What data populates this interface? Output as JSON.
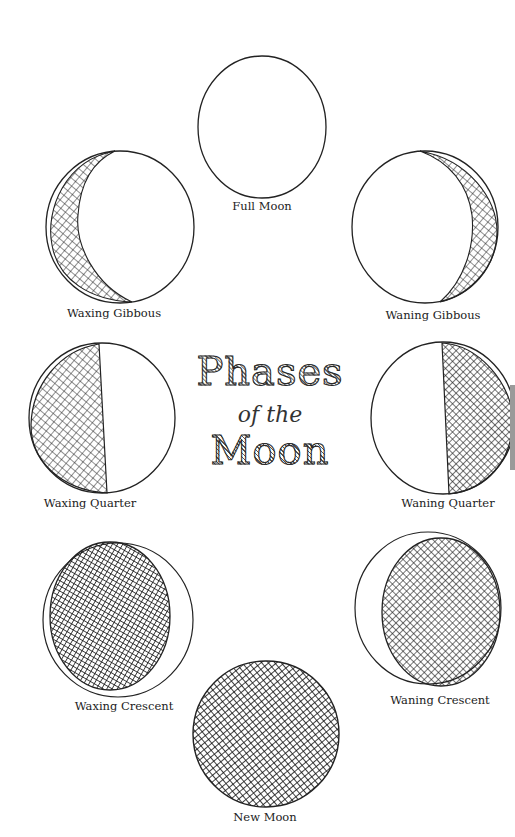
{
  "title": {
    "line1": "Phases",
    "line2": "of the",
    "line3": "Moon"
  },
  "phases": [
    {
      "name": "Full Moon",
      "label": "Full Moon"
    },
    {
      "name": "Waxing Gibbous",
      "label": "Waxing Gibbous"
    },
    {
      "name": "Waning Gibbous",
      "label": "Waning Gibbous"
    },
    {
      "name": "Waxing Quarter",
      "label": "Waxing Quarter"
    },
    {
      "name": "Waning Quarter",
      "label": "Waning Quarter"
    },
    {
      "name": "Waxing Crescent",
      "label": "Waxing Crescent"
    },
    {
      "name": "Waning Crescent",
      "label": "Waning Crescent"
    },
    {
      "name": "New Moon",
      "label": "New Moon"
    }
  ],
  "colors": {
    "ink": "#222222",
    "paper": "#ffffff"
  }
}
